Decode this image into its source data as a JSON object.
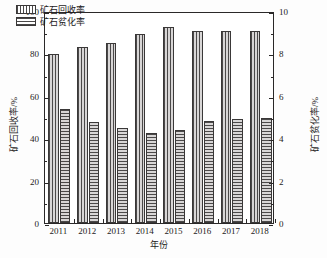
{
  "chart_data": {
    "type": "bar",
    "title": "",
    "xlabel": "年份",
    "ylabel": "矿石回收率/%",
    "ylabel_secondary": "矿石贫化率/%",
    "categories": [
      "2011",
      "2012",
      "2013",
      "2014",
      "2015",
      "2016",
      "2017",
      "2018"
    ],
    "ylim": [
      0,
      100
    ],
    "ylim_secondary": [
      0,
      10
    ],
    "yticks": [
      "0",
      "20",
      "40",
      "60",
      "80",
      "100"
    ],
    "ytick_values": [
      0,
      20,
      40,
      60,
      80,
      100
    ],
    "yticks_secondary": [
      "0",
      "2",
      "4",
      "6",
      "8",
      "10"
    ],
    "ytick_values_secondary": [
      0,
      2,
      4,
      6,
      8,
      10
    ],
    "grid": false,
    "legend_position": "upper left",
    "series": [
      {
        "name": "矿石回收率",
        "axis": "left",
        "unit": "%",
        "hatch": "vertical",
        "values": [
          79.5,
          83.0,
          85.0,
          89.0,
          92.5,
          90.5,
          90.5,
          90.5
        ]
      },
      {
        "name": "矿石贫化率",
        "axis": "right",
        "unit": "%",
        "hatch": "horizontal",
        "values": [
          5.4,
          4.75,
          4.5,
          4.25,
          4.4,
          4.8,
          4.9,
          4.95
        ]
      }
    ]
  },
  "colors": {
    "axis": "#2a2828",
    "bar_edge": "#3a3838",
    "hatch_dark": "#4b4949",
    "hatch_light": "#d8d6d6",
    "background": "#ffffff",
    "text": "#1d1b1b"
  }
}
